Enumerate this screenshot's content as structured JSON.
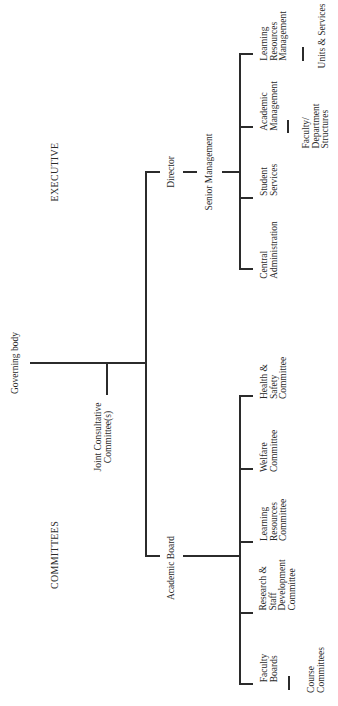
{
  "sections": {
    "executive": "EXECUTIVE",
    "committees": "COMMITTEES"
  },
  "root": {
    "label": "Governing body",
    "joint": "Joint Consultative\nCommittee(s)"
  },
  "executive": {
    "director": "Director",
    "senior": "Senior Management",
    "units": [
      {
        "label": "Central\nAdministration"
      },
      {
        "label": "Student\nServices"
      },
      {
        "label": "Academic\nManagement",
        "sub": "Faculty/\nDepartment\nStructures"
      },
      {
        "label": "Learning\nResources\nManagement",
        "sub": "Units & Services"
      }
    ]
  },
  "committees": {
    "board": "Academic Board",
    "items": [
      {
        "label": "Faculty\nBoards",
        "sub": "Course\nCommittees"
      },
      {
        "label": "Research &\nStaff\nDevelopment\nCommittee"
      },
      {
        "label": "Learning\nResources\nCommittee"
      },
      {
        "label": "Welfare\nCommittee"
      },
      {
        "label": "Health &\nSafety\nCommittee"
      }
    ]
  }
}
